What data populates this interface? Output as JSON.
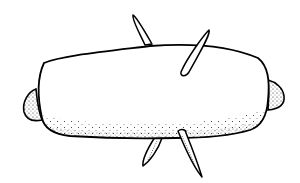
{
  "illustration": {
    "subject": "bread loaf / dumpling with toothpicks",
    "colors": {
      "ink": "#000000",
      "paper": "#ffffff",
      "stipple": "#1a1a1a"
    },
    "elements": [
      "body",
      "left-end-cap",
      "right-end-cap",
      "toothpick-top-left",
      "toothpick-top-right",
      "toothpick-bottom-left",
      "toothpick-bottom-right"
    ]
  }
}
